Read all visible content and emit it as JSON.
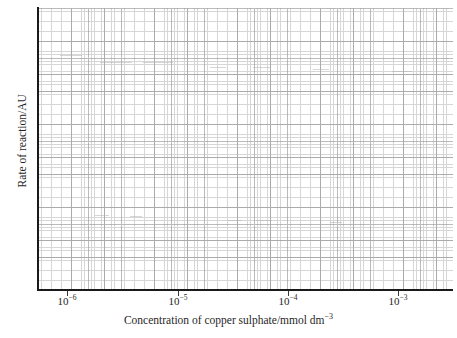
{
  "chart_data": {
    "type": "line",
    "title": "",
    "subtitle": "",
    "xlabel_parts": {
      "text": "Concentration of copper sulphate/mmol dm",
      "exponent": "−3"
    },
    "xlabel": "Concentration of copper sulphate/mmol dm−3",
    "ylabel": "Rate of reaction/AU",
    "xscale": "log",
    "yscale": "linear",
    "xlim": [
      3.2e-07,
      0.0026
    ],
    "ylim": [
      0,
      1
    ],
    "grid": true,
    "grid_style": "graph-paper minor and major gridlines",
    "legend": "none",
    "series": [],
    "values": [],
    "categories": [],
    "annotations": [],
    "note": "Blank log-linear graph paper axes; no data series plotted.",
    "xticks": [
      {
        "value": 1e-06,
        "mantissa": "10",
        "exponent": "−6",
        "x_px": 67
      },
      {
        "value": 1e-05,
        "mantissa": "10",
        "exponent": "−5",
        "x_px": 178
      },
      {
        "value": 0.0001,
        "mantissa": "10",
        "exponent": "−4",
        "x_px": 288
      },
      {
        "value": 0.001,
        "mantissa": "10",
        "exponent": "−3",
        "x_px": 398
      }
    ],
    "yticks": [],
    "ytick_labels": []
  },
  "colors": {
    "background": "#ffffff",
    "minor_grid": "#c9c9c9",
    "major_grid": "#8f8f8f",
    "axis_spine": "#1a1a1a",
    "text": "#1f1f1f"
  },
  "artifacts": [
    {
      "left_px": 60,
      "top_px": 55,
      "width_px": 22
    },
    {
      "left_px": 100,
      "top_px": 62,
      "width_px": 32
    },
    {
      "left_px": 143,
      "top_px": 62,
      "width_px": 30
    },
    {
      "left_px": 210,
      "top_px": 67,
      "width_px": 16
    },
    {
      "left_px": 253,
      "top_px": 67,
      "width_px": 18
    },
    {
      "left_px": 313,
      "top_px": 69,
      "width_px": 16
    },
    {
      "left_px": 392,
      "top_px": 71,
      "width_px": 20
    },
    {
      "left_px": 95,
      "top_px": 215,
      "width_px": 14
    },
    {
      "left_px": 130,
      "top_px": 216,
      "width_px": 12
    },
    {
      "left_px": 228,
      "top_px": 220,
      "width_px": 14
    },
    {
      "left_px": 256,
      "top_px": 220,
      "width_px": 16
    },
    {
      "left_px": 330,
      "top_px": 222,
      "width_px": 12
    }
  ]
}
